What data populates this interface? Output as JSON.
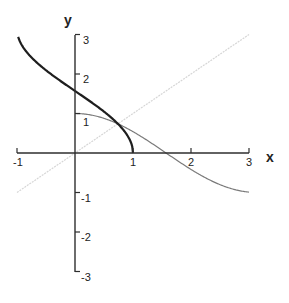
{
  "chart_data": {
    "type": "line",
    "title": "",
    "xlabel": "x",
    "ylabel": "y",
    "xlim": [
      -1,
      3
    ],
    "ylim": [
      -3,
      3
    ],
    "grid": false,
    "legend": null,
    "x_ticks": [
      -1,
      1,
      2,
      3
    ],
    "x_tick_labels": [
      "-1",
      "1",
      "2",
      "3"
    ],
    "y_ticks": [
      -3,
      -2,
      -1,
      1,
      2,
      3
    ],
    "y_tick_labels": [
      "-3",
      "-2",
      "-1",
      "1",
      "2",
      "3"
    ],
    "series": [
      {
        "name": "y = x",
        "function": "x",
        "domain": [
          -1,
          3
        ],
        "color": "#d6d6d6",
        "style": "dotted-light",
        "x": [
          -1,
          0,
          1,
          2,
          3
        ],
        "values": [
          -1,
          0,
          1,
          2,
          3
        ]
      },
      {
        "name": "y = cos(x)",
        "function": "cos",
        "domain": [
          0,
          3
        ],
        "color": "#7a7a7a",
        "style": "solid-thin",
        "x": [
          0,
          0.5,
          1,
          1.5,
          2,
          2.5,
          3
        ],
        "values": [
          1,
          0.88,
          0.54,
          0.07,
          -0.42,
          -0.8,
          -0.99
        ]
      },
      {
        "name": "y = arccos(x)",
        "function": "arccos",
        "domain": [
          -0.98,
          1
        ],
        "color": "#1e1e1e",
        "style": "solid-thick",
        "x": [
          -0.98,
          -0.5,
          0,
          0.5,
          0.739,
          1
        ],
        "values": [
          2.94,
          2.09,
          1.57,
          1.05,
          0.74,
          0
        ]
      }
    ],
    "annotations": [
      {
        "text": "intersection of all three curves",
        "x": 0.739,
        "y": 0.739
      }
    ]
  },
  "labels": {
    "x_axis": "x",
    "y_axis": "y"
  }
}
